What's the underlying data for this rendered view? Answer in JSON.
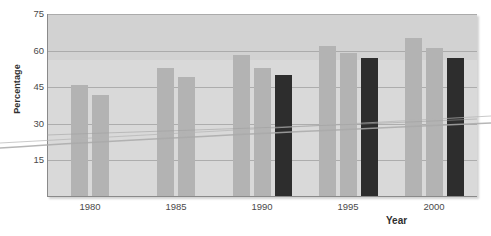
{
  "chart_data": {
    "type": "bar",
    "title": "",
    "subtitle": "",
    "xlabel": "Year",
    "ylabel": "Percentage",
    "categories": [
      "1980",
      "1985",
      "1990",
      "1995",
      "2000"
    ],
    "ylim": [
      0,
      75
    ],
    "yticks": [
      15,
      30,
      45,
      60,
      75
    ],
    "ytick_labels": [
      "15",
      "30",
      "45",
      "60",
      "75"
    ],
    "grid": true,
    "legend": "none",
    "series": [
      {
        "name": "Series 1",
        "color": "#b3b3b3",
        "values": [
          46,
          53,
          58,
          62,
          65
        ]
      },
      {
        "name": "Series 2",
        "color": "#b3b3b3",
        "values": [
          42,
          49,
          53,
          59,
          61
        ]
      },
      {
        "name": "Series 3",
        "color": "#2d2d2d",
        "values": [
          null,
          null,
          50,
          57,
          57
        ]
      }
    ],
    "groups": [
      {
        "category": "1980",
        "bars": [
          {
            "value": 46,
            "color": "#b3b3b3"
          },
          {
            "value": 42,
            "color": "#b3b3b3"
          }
        ]
      },
      {
        "category": "1985",
        "bars": [
          {
            "value": 53,
            "color": "#b3b3b3"
          },
          {
            "value": 49,
            "color": "#b3b3b3"
          }
        ]
      },
      {
        "category": "1990",
        "bars": [
          {
            "value": 58,
            "color": "#b3b3b3"
          },
          {
            "value": 53,
            "color": "#b3b3b3"
          },
          {
            "value": 50,
            "color": "#2d2d2d"
          }
        ]
      },
      {
        "category": "1995",
        "bars": [
          {
            "value": 62,
            "color": "#b3b3b3"
          },
          {
            "value": 59,
            "color": "#b3b3b3"
          },
          {
            "value": 57,
            "color": "#2d2d2d"
          }
        ]
      },
      {
        "category": "2000",
        "bars": [
          {
            "value": 65,
            "color": "#b3b3b3"
          },
          {
            "value": 61,
            "color": "#b3b3b3"
          },
          {
            "value": 57,
            "color": "#2d2d2d"
          }
        ]
      }
    ],
    "colors": {
      "bar_light": "#b3b3b3",
      "bar_dark": "#2d2d2d",
      "plot_background": "#d9d9d9",
      "plot_background_upper": "#d2d2d2",
      "gridline": "#9d9d9d",
      "axis": "#8a8a8a",
      "text": "#4a4a4a"
    }
  }
}
